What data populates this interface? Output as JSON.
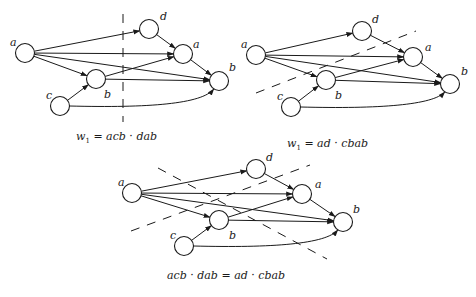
{
  "figure": {
    "diagrams": [
      {
        "id": "left",
        "caption": {
          "var": "w",
          "sub": "1",
          "eq": " = ",
          "lhs": "acb",
          "dot": " · ",
          "rhs": "dab"
        },
        "nodes": [
          {
            "id": "a1",
            "label": "a",
            "cx": 25,
            "cy": 53,
            "lx": 10,
            "ly": 46
          },
          {
            "id": "b1",
            "label": "b",
            "cx": 96,
            "cy": 79,
            "lx": 104,
            "ly": 98
          },
          {
            "id": "c1",
            "label": "c",
            "cx": 60,
            "cy": 106,
            "lx": 46,
            "ly": 99
          },
          {
            "id": "d1",
            "label": "d",
            "cx": 149,
            "cy": 29,
            "lx": 160,
            "ly": 20
          },
          {
            "id": "a2",
            "label": "a",
            "cx": 183,
            "cy": 54,
            "lx": 193,
            "ly": 48
          },
          {
            "id": "b2",
            "label": "b",
            "cx": 219,
            "cy": 81,
            "lx": 229,
            "ly": 71
          }
        ],
        "cut": {
          "x1": 123,
          "y1": 14,
          "x2": 123,
          "y2": 122
        }
      },
      {
        "id": "right",
        "caption": {
          "var": "w",
          "sub": "1",
          "eq": " = ",
          "lhs": "ad",
          "dot": " · ",
          "rhs": "cbab"
        },
        "nodes": [
          {
            "id": "a1",
            "label": "a",
            "cx": 256,
            "cy": 55,
            "lx": 241,
            "ly": 48
          },
          {
            "id": "b1",
            "label": "b",
            "cx": 326,
            "cy": 80,
            "lx": 335,
            "ly": 99
          },
          {
            "id": "c1",
            "label": "c",
            "cx": 291,
            "cy": 107,
            "lx": 277,
            "ly": 100
          },
          {
            "id": "d1",
            "label": "d",
            "cx": 362,
            "cy": 31,
            "lx": 372,
            "ly": 23
          },
          {
            "id": "a2",
            "label": "a",
            "cx": 413,
            "cy": 57,
            "lx": 425,
            "ly": 51
          },
          {
            "id": "b2",
            "label": "b",
            "cx": 450,
            "cy": 84,
            "lx": 461,
            "ly": 75
          }
        ],
        "cut": {
          "x1": 256,
          "y1": 93,
          "x2": 416,
          "y2": 31
        }
      },
      {
        "id": "bottom",
        "caption": {
          "lhs_a": "acb",
          "dot1": " · ",
          "lhs_b": "dab",
          "eq": " = ",
          "rhs_a": "ad",
          "dot2": " · ",
          "rhs_b": "cbab"
        },
        "nodes": [
          {
            "id": "a1",
            "label": "a",
            "cx": 132,
            "cy": 193,
            "lx": 118,
            "ly": 186
          },
          {
            "id": "b1",
            "label": "b",
            "cx": 219,
            "cy": 220,
            "lx": 229,
            "ly": 239
          },
          {
            "id": "c1",
            "label": "c",
            "cx": 184,
            "cy": 246,
            "lx": 170,
            "ly": 239
          },
          {
            "id": "d1",
            "label": "d",
            "cx": 256,
            "cy": 169,
            "lx": 266,
            "ly": 161
          },
          {
            "id": "a2",
            "label": "a",
            "cx": 302,
            "cy": 194,
            "lx": 315,
            "ly": 188
          },
          {
            "id": "b2",
            "label": "b",
            "cx": 343,
            "cy": 222,
            "lx": 353,
            "ly": 213
          }
        ],
        "cuts": [
          {
            "x1": 131,
            "y1": 231,
            "x2": 310,
            "y2": 165
          },
          {
            "x1": 158,
            "y1": 168,
            "x2": 327,
            "y2": 259
          }
        ]
      }
    ],
    "edges": [
      [
        "a1",
        "d1"
      ],
      [
        "a1",
        "a2"
      ],
      [
        "a1",
        "b2"
      ],
      [
        "a1",
        "b1"
      ],
      [
        "c1",
        "b1"
      ],
      [
        "b1",
        "a2"
      ],
      [
        "b1",
        "b2"
      ],
      [
        "d1",
        "a2"
      ],
      [
        "a2",
        "b2"
      ],
      [
        "c1",
        "b2",
        "curve"
      ]
    ]
  }
}
